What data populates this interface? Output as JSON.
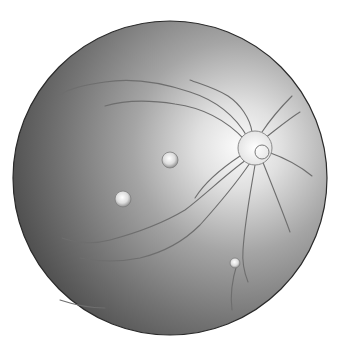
{
  "image": {
    "subject": "retinal fundus illustration",
    "colors": {
      "background": "#ffffff",
      "fundus_dark": "#4a4a4a",
      "fundus_mid": "#8a8a8a",
      "fundus_bright": "#f4f4f4",
      "rim": "#2a2a2a",
      "vessel": "#6e6e6e"
    },
    "fundus": {
      "cx": 170,
      "cy": 178,
      "r": 157
    },
    "optic_disc": {
      "cx": 255,
      "cy": 148,
      "r": 17
    },
    "spots": [
      {
        "cx": 170,
        "cy": 160,
        "r": 8
      },
      {
        "cx": 123,
        "cy": 199,
        "r": 8
      },
      {
        "cx": 235,
        "cy": 263,
        "r": 5
      }
    ]
  }
}
